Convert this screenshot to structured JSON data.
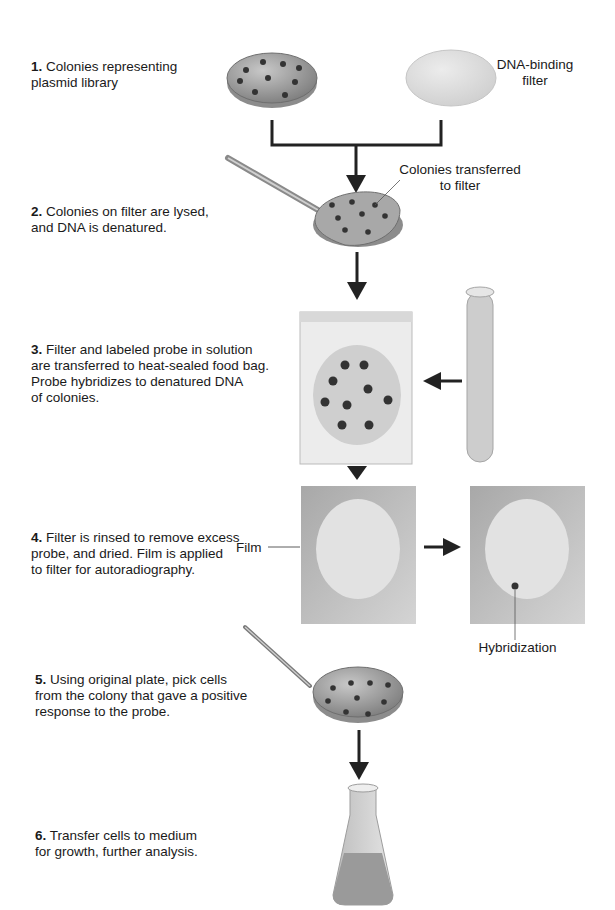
{
  "steps": [
    {
      "num": "1.",
      "text": "Colonies representing",
      "text2": "plasmid library"
    },
    {
      "num": "2.",
      "text": "Colonies on filter are lysed,",
      "text2": "and DNA is denatured."
    },
    {
      "num": "3.",
      "text": "Filter and labeled probe in solution",
      "text2": "are transferred to heat-sealed food bag.",
      "text3": "Probe hybridizes to denatured DNA",
      "text4": "of colonies."
    },
    {
      "num": "4.",
      "text": "Filter is rinsed to remove excess",
      "text2": "probe, and dried. Film is applied",
      "text3": "to filter for autoradiography."
    },
    {
      "num": "5.",
      "text": "Using original plate, pick cells",
      "text2": "from the colony that gave a positive",
      "text3": "response to the probe."
    },
    {
      "num": "6.",
      "text": "Transfer cells to medium",
      "text2": "for growth, further analysis."
    }
  ],
  "labels": {
    "filter_line1": "DNA-binding",
    "filter_line2": "filter",
    "colonies_line1": "Colonies transferred",
    "colonies_line2": "to filter",
    "film": "Film",
    "hybridization": "Hybridization"
  },
  "colors": {
    "plate": "#9a9a9a",
    "colony": "#333333",
    "filter": "#d9d9d9",
    "arrow": "#222222",
    "bag": "#e6e6e6",
    "film": "#bdbdbd"
  }
}
